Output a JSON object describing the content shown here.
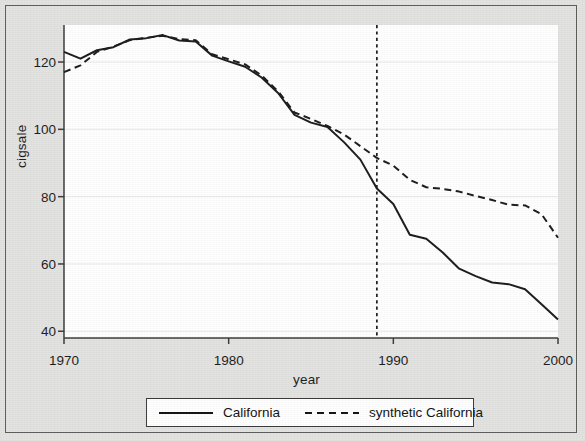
{
  "figure": {
    "background_color": "#e2e2e0",
    "plot_background_color": "#ffffff",
    "line_color": "#1a1a1a",
    "grid_color": "#e8e8e8",
    "frame_color": "#5c5c5c"
  },
  "axes": {
    "xlabel": "year",
    "ylabel": "cigsale",
    "xticks": [
      1970,
      1980,
      1990,
      2000
    ],
    "xtick_labels": [
      "1970",
      "1980",
      "1990",
      "2000"
    ],
    "yticks": [
      40,
      60,
      80,
      100,
      120
    ],
    "ytick_labels": [
      "40",
      "60",
      "80",
      "100",
      "120"
    ],
    "xlim": [
      1970,
      2000
    ],
    "ylim": [
      38,
      131
    ],
    "grid": "horizontal"
  },
  "legend": {
    "position": "below-axes",
    "entries": [
      {
        "label": "California",
        "style": "solid",
        "key": "solid-line-key"
      },
      {
        "label": "synthetic California",
        "style": "dashed",
        "key": "dashed-line-key"
      }
    ]
  },
  "annotations": [
    {
      "name": "treatment-line",
      "type": "vline",
      "x": 1989,
      "style": "dashed",
      "label": ""
    }
  ],
  "chart_data": {
    "type": "line",
    "title": "",
    "xlabel": "year",
    "ylabel": "cigsale",
    "xlim": [
      1970,
      2000
    ],
    "ylim": [
      38,
      131
    ],
    "grid": "horizontal",
    "legend_position": "below",
    "x": [
      1970,
      1971,
      1972,
      1973,
      1974,
      1975,
      1976,
      1977,
      1978,
      1979,
      1980,
      1981,
      1982,
      1983,
      1984,
      1985,
      1986,
      1987,
      1988,
      1989,
      1990,
      1991,
      1992,
      1993,
      1994,
      1995,
      1996,
      1997,
      1998,
      1999,
      2000
    ],
    "series": [
      {
        "name": "California",
        "style": "solid",
        "values": [
          123.0,
          121.0,
          123.5,
          124.4,
          126.7,
          127.1,
          128.0,
          126.4,
          126.1,
          121.9,
          120.2,
          118.6,
          115.4,
          110.8,
          104.3,
          102.0,
          100.7,
          96.2,
          91.0,
          82.4,
          77.8,
          68.7,
          67.5,
          63.4,
          58.6,
          56.4,
          54.5,
          54.0,
          52.5,
          48.0,
          43.5
        ]
      },
      {
        "name": "synthetic California",
        "style": "dashed",
        "values": [
          117.0,
          119.0,
          123.0,
          124.6,
          126.5,
          127.2,
          127.8,
          126.8,
          126.5,
          122.3,
          120.8,
          119.3,
          116.0,
          111.3,
          105.0,
          103.1,
          101.0,
          98.5,
          95.0,
          91.5,
          89.2,
          85.0,
          82.8,
          82.3,
          81.5,
          80.2,
          79.0,
          77.6,
          77.4,
          74.8,
          67.8
        ]
      }
    ],
    "annotations": [
      {
        "type": "vline",
        "x": 1989,
        "style": "dashed",
        "text": "Proposition 99 passage"
      }
    ]
  }
}
